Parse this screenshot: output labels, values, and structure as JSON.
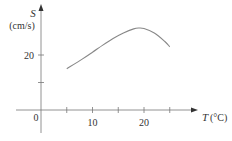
{
  "chart_data": {
    "type": "line",
    "title": "",
    "xlabel": "T (°C)",
    "ylabel": "S (cm/s)",
    "ylabel_symbol": "S",
    "ylabel_unit": "(cm/s)",
    "xlabel_symbol": "T",
    "xlabel_unit": "(°C)",
    "origin_label": "0",
    "x_ticks": [
      5,
      10,
      15,
      20,
      25
    ],
    "x_tick_labels": [
      "10",
      "20"
    ],
    "y_ticks": [
      10,
      20
    ],
    "y_tick_labels": [
      "20"
    ],
    "xlim": [
      -2.5,
      28
    ],
    "ylim": [
      -10,
      35
    ],
    "grid": false,
    "series": [
      {
        "name": "S(T)",
        "x": [
          5,
          8,
          10,
          12,
          14,
          16,
          18,
          19,
          20,
          22,
          24,
          25
        ],
        "y": [
          15,
          18.5,
          21,
          23.6,
          26,
          28,
          29.5,
          29.8,
          29.6,
          28,
          25,
          23
        ]
      }
    ],
    "color": "#888888"
  }
}
